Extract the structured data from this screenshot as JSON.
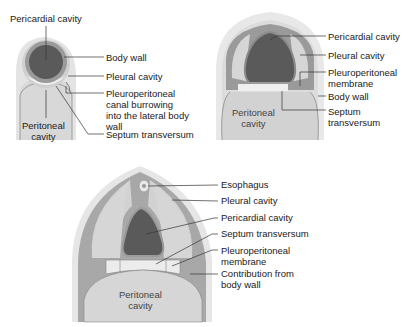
{
  "panel_a": {
    "labels": {
      "pericardial_cavity": "Pericardial cavity",
      "body_wall": "Body wall",
      "pleural_cavity": "Pleural cavity",
      "pp_canal_1": "Pleuroperitoneal",
      "pp_canal_2": "canal burrowing",
      "pp_canal_3": "into the lateral body",
      "pp_canal_4": "wall",
      "septum_transversum": "Septum transversum",
      "peritoneal_1": "Peritoneal",
      "peritoneal_2": "cavity"
    }
  },
  "panel_b": {
    "labels": {
      "pericardial_cavity": "Pericardial cavity",
      "pleural_cavity": "Pleural cavity",
      "pp_membrane_1": "Pleuroperitoneal",
      "pp_membrane_2": "membrane",
      "body_wall": "Body wall",
      "septum_1": "Septum",
      "septum_2": "transversum",
      "peritoneal_1": "Peritoneal",
      "peritoneal_2": "cavity"
    }
  },
  "panel_c": {
    "labels": {
      "esophagus": "Esophagus",
      "pleural_cavity": "Pleural cavity",
      "pericardial_cavity": "Pericardial cavity",
      "septum_transversum": "Septum transversum",
      "pp_membrane_1": "Pleuroperitoneal",
      "pp_membrane_2": "membrane",
      "contribution_1": "Contribution from",
      "contribution_2": "body wall",
      "peritoneal_1": "Peritoneal",
      "peritoneal_2": "cavity"
    }
  },
  "colors": {
    "pericardial": "#5a5a5a",
    "body_wall_dark": "#9a9a9a",
    "pleural": "#d2d2d2",
    "outer": "#e6e6e6",
    "septum": "#ececec",
    "leader": "#333333"
  }
}
